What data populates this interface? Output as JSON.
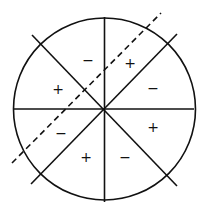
{
  "diagram": {
    "circle": {
      "cx": 104.5,
      "cy": 109,
      "r": 91
    },
    "lines": [
      {
        "name": "vertical-line",
        "x1": 104.5,
        "y1": 17,
        "x2": 104.5,
        "y2": 202
      },
      {
        "name": "horizontal-line",
        "x1": 14,
        "y1": 109,
        "x2": 194,
        "y2": 109
      },
      {
        "name": "diagonal-nw-se-line",
        "x1": 32,
        "y1": 35,
        "x2": 177,
        "y2": 186
      },
      {
        "name": "diagonal-sw-ne-line",
        "x1": 31,
        "y1": 184,
        "x2": 177,
        "y2": 34
      }
    ],
    "dashed_line": {
      "x1": 12,
      "y1": 163,
      "x2": 161,
      "y2": 13
    },
    "signs": [
      {
        "label": "−",
        "x": 88,
        "y": 60
      },
      {
        "label": "+",
        "x": 130,
        "y": 63
      },
      {
        "label": "+",
        "x": 58,
        "y": 89
      },
      {
        "label": "−",
        "x": 153,
        "y": 88
      },
      {
        "label": "−",
        "x": 61,
        "y": 133
      },
      {
        "label": "+",
        "x": 153,
        "y": 127
      },
      {
        "label": "+",
        "x": 86,
        "y": 157
      },
      {
        "label": "−",
        "x": 125,
        "y": 157
      }
    ],
    "colors": {
      "stroke": "#111111",
      "background": "#ffffff"
    }
  }
}
